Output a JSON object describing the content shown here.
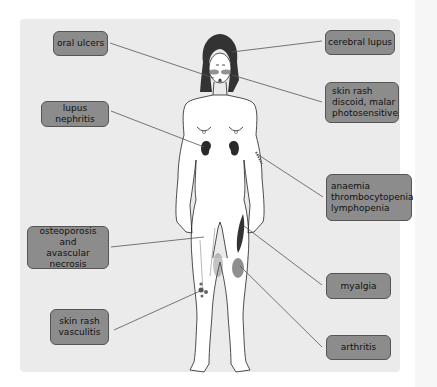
{
  "diagram": {
    "type": "anatomical-annotation",
    "colors": {
      "panel_bg": "#ebebeb",
      "label_bg": "#8c8c8c",
      "label_border": "#555555",
      "leader_line": "#555555",
      "lesion": "#444444"
    },
    "labels": [
      {
        "id": "oral-ulcers",
        "text": "oral ulcers",
        "side": "left",
        "target": "mouth"
      },
      {
        "id": "lupus-nephritis",
        "text": "lupus nephritis",
        "side": "left",
        "target": "kidneys"
      },
      {
        "id": "osteoporosis",
        "text": "osteoporosis\nand\navascular necrosis",
        "side": "left",
        "target": "femur"
      },
      {
        "id": "skin-rash-vasculitis",
        "text": "skin rash\nvasculitis",
        "side": "left",
        "target": "lower leg spots"
      },
      {
        "id": "cerebral-lupus",
        "text": "cerebral lupus",
        "side": "right",
        "target": "head"
      },
      {
        "id": "skin-rash-discoid",
        "text": "skin rash\ndiscoid, malar\nphotosensitive",
        "side": "right",
        "target": "face (malar rash)"
      },
      {
        "id": "anaemia",
        "text": "anaemia\nthrombocytopenia\nlymphopenia",
        "side": "right",
        "target": "arm blood vessel"
      },
      {
        "id": "myalgia",
        "text": "myalgia",
        "side": "right",
        "target": "thigh muscle"
      },
      {
        "id": "arthritis",
        "text": "arthritis",
        "side": "right",
        "target": "knee joint"
      }
    ]
  }
}
